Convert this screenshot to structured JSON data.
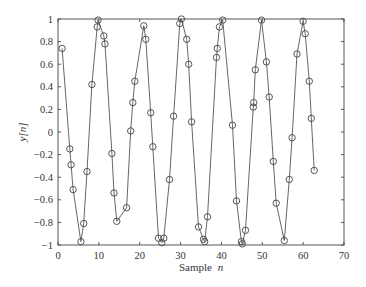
{
  "chart_data": {
    "type": "line",
    "title": "",
    "xlabel": "Sample",
    "xlabel_var": "n",
    "ylabel": "y[n]",
    "xlim": [
      0,
      70
    ],
    "ylim": [
      -1,
      1
    ],
    "xticks": [
      0,
      10,
      20,
      30,
      40,
      50,
      60,
      70
    ],
    "yticks": [
      -1,
      -0.8,
      -0.6,
      -0.4,
      -0.2,
      0,
      0.2,
      0.4,
      0.6,
      0.8,
      1
    ],
    "ytick_labels": [
      "−1",
      "−0.8",
      "−0.6",
      "−0.4",
      "−0.2",
      "0",
      "0.2",
      "0.4",
      "0.6",
      "0.8",
      "1"
    ],
    "grid": false,
    "legend": null,
    "marker": "circle",
    "line_color": "#555555",
    "series": [
      {
        "name": "y[n]",
        "points": [
          [
            1.0,
            0.74
          ],
          [
            2.9,
            -0.15
          ],
          [
            3.2,
            -0.29
          ],
          [
            3.7,
            -0.51
          ],
          [
            5.6,
            -0.97
          ],
          [
            6.3,
            -0.81
          ],
          [
            7.1,
            -0.35
          ],
          [
            8.3,
            0.42
          ],
          [
            9.6,
            0.93
          ],
          [
            9.8,
            0.99
          ],
          [
            11.2,
            0.85
          ],
          [
            11.5,
            0.78
          ],
          [
            13.2,
            -0.19
          ],
          [
            13.7,
            -0.54
          ],
          [
            14.4,
            -0.79
          ],
          [
            16.8,
            -0.67
          ],
          [
            17.8,
            0.01
          ],
          [
            18.3,
            0.26
          ],
          [
            18.8,
            0.45
          ],
          [
            21.0,
            0.94
          ],
          [
            21.5,
            0.82
          ],
          [
            22.7,
            0.17
          ],
          [
            23.2,
            -0.13
          ],
          [
            24.6,
            -0.94
          ],
          [
            25.4,
            -0.98
          ],
          [
            25.9,
            -0.94
          ],
          [
            27.3,
            -0.42
          ],
          [
            28.3,
            0.14
          ],
          [
            29.8,
            0.96
          ],
          [
            30.2,
            1.0
          ],
          [
            31.5,
            0.82
          ],
          [
            32.0,
            0.6
          ],
          [
            32.7,
            0.09
          ],
          [
            34.4,
            -0.84
          ],
          [
            35.6,
            -0.95
          ],
          [
            35.9,
            -0.97
          ],
          [
            36.6,
            -0.75
          ],
          [
            38.8,
            0.66
          ],
          [
            39.0,
            0.74
          ],
          [
            39.5,
            0.93
          ],
          [
            40.3,
            0.99
          ],
          [
            42.7,
            0.06
          ],
          [
            43.7,
            -0.61
          ],
          [
            44.9,
            -0.97
          ],
          [
            45.1,
            -0.99
          ],
          [
            45.9,
            -0.87
          ],
          [
            47.8,
            0.22
          ],
          [
            47.9,
            0.26
          ],
          [
            48.3,
            0.55
          ],
          [
            49.8,
            0.99
          ],
          [
            51.0,
            0.62
          ],
          [
            51.7,
            0.31
          ],
          [
            52.7,
            -0.26
          ],
          [
            53.4,
            -0.63
          ],
          [
            55.4,
            -0.96
          ],
          [
            56.6,
            -0.42
          ],
          [
            57.3,
            -0.05
          ],
          [
            58.5,
            0.69
          ],
          [
            60.0,
            0.98
          ],
          [
            60.5,
            0.87
          ],
          [
            61.5,
            0.45
          ],
          [
            62.0,
            0.12
          ],
          [
            62.7,
            -0.34
          ]
        ]
      }
    ]
  }
}
